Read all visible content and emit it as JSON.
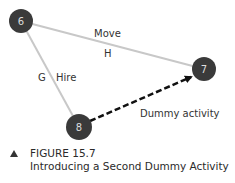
{
  "diagram": {
    "nodes": [
      {
        "id": "6",
        "label": "6",
        "x": 21,
        "y": 21
      },
      {
        "id": "7",
        "label": "7",
        "x": 204,
        "y": 69
      },
      {
        "id": "8",
        "label": "8",
        "x": 79,
        "y": 127
      }
    ],
    "edges": [
      {
        "from": "6",
        "to": "7",
        "name": "Move",
        "code": "H",
        "style": "solid"
      },
      {
        "from": "6",
        "to": "8",
        "name": "Hire",
        "code": "G",
        "style": "solid"
      },
      {
        "from": "8",
        "to": "7",
        "name": "Dummy activity",
        "style": "dashed-arrow"
      }
    ],
    "labels": {
      "move": "Move",
      "h": "H",
      "g": "G",
      "hire": "Hire",
      "dummy": "Dummy activity"
    },
    "colors": {
      "node": "#3a3a3a",
      "edge": "#c8c8c8",
      "dummy": "#111111"
    }
  },
  "caption": {
    "figure": "FIGURE 15.7",
    "title": "Introducing a Second Dummy Activity"
  }
}
